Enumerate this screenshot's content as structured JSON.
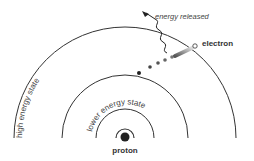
{
  "diagram": {
    "labels": {
      "high_state": "high energy state",
      "lower_state": "lower energy state",
      "energy_released": "energy released",
      "electron": "electron",
      "proton": "proton"
    },
    "colors": {
      "line": "#333333",
      "dot": "#222222",
      "text": "#333333"
    }
  }
}
